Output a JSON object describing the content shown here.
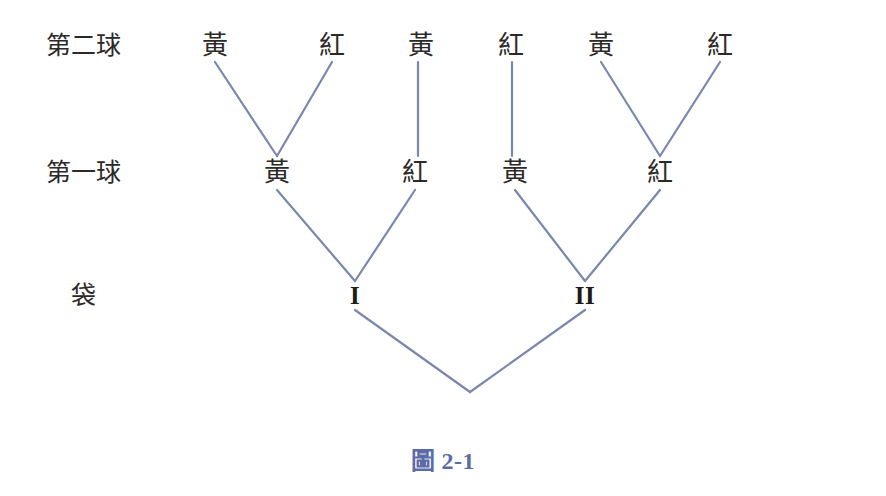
{
  "figure": {
    "caption_prefix": "圖",
    "caption_number": "2-1",
    "caption_color": "#5b6ba8",
    "background_color": "#ffffff",
    "edge_color": "#7b87ac",
    "edge_width": 2.2,
    "text_color": "#2c2a28"
  },
  "row_labels": [
    {
      "id": "row-second-ball",
      "text": "第二球",
      "x": 83,
      "y": 45
    },
    {
      "id": "row-first-ball",
      "text": "第一球",
      "x": 83,
      "y": 172
    },
    {
      "id": "row-bag",
      "text": "袋",
      "x": 83,
      "y": 295
    }
  ],
  "levels": {
    "second_ball_y": 45,
    "first_ball_y": 172,
    "bag_y": 295,
    "root_y": 392
  },
  "nodes": {
    "root": {
      "id": "root",
      "label": "",
      "x": 470,
      "y": 392
    },
    "bags": [
      {
        "id": "bag-1",
        "label": "I",
        "x": 355,
        "y": 295
      },
      {
        "id": "bag-2",
        "label": "II",
        "x": 585,
        "y": 295
      }
    ],
    "first_ball": [
      {
        "id": "first-ball-1",
        "label": "黃",
        "x": 277,
        "y": 172,
        "parent": "bag-1"
      },
      {
        "id": "first-ball-2",
        "label": "紅",
        "x": 415,
        "y": 172,
        "parent": "bag-1"
      },
      {
        "id": "first-ball-3",
        "label": "黃",
        "x": 515,
        "y": 172,
        "parent": "bag-2"
      },
      {
        "id": "first-ball-4",
        "label": "紅",
        "x": 660,
        "y": 172,
        "parent": "bag-2"
      }
    ],
    "second_ball": [
      {
        "id": "second-ball-1",
        "label": "黃",
        "x": 215,
        "y": 45,
        "parent": "first-ball-1"
      },
      {
        "id": "second-ball-2",
        "label": "紅",
        "x": 332,
        "y": 45,
        "parent": "first-ball-1"
      },
      {
        "id": "second-ball-3",
        "label": "黃",
        "x": 421,
        "y": 45,
        "parent": "first-ball-2"
      },
      {
        "id": "second-ball-4",
        "label": "紅",
        "x": 511,
        "y": 45,
        "parent": "first-ball-3"
      },
      {
        "id": "second-ball-5",
        "label": "黃",
        "x": 601,
        "y": 45,
        "parent": "first-ball-4"
      },
      {
        "id": "second-ball-6",
        "label": "紅",
        "x": 720,
        "y": 45,
        "parent": "first-ball-4"
      }
    ]
  },
  "edges": [
    {
      "id": "edge-root-bag1",
      "x1": 470,
      "y1": 392,
      "x2": 355,
      "y2": 310
    },
    {
      "id": "edge-root-bag2",
      "x1": 470,
      "y1": 392,
      "x2": 585,
      "y2": 310
    },
    {
      "id": "edge-bag1-yellow",
      "x1": 355,
      "y1": 281,
      "x2": 277,
      "y2": 190
    },
    {
      "id": "edge-bag1-red",
      "x1": 355,
      "y1": 281,
      "x2": 415,
      "y2": 190
    },
    {
      "id": "edge-bag2-yellow",
      "x1": 585,
      "y1": 281,
      "x2": 515,
      "y2": 190
    },
    {
      "id": "edge-bag2-red",
      "x1": 585,
      "y1": 281,
      "x2": 660,
      "y2": 190
    },
    {
      "id": "edge-fb1-yellow",
      "x1": 277,
      "y1": 156,
      "x2": 215,
      "y2": 62
    },
    {
      "id": "edge-fb1-red",
      "x1": 277,
      "y1": 156,
      "x2": 332,
      "y2": 62
    },
    {
      "id": "edge-fb2-yellow",
      "x1": 418,
      "y1": 156,
      "x2": 418,
      "y2": 62
    },
    {
      "id": "edge-fb3-red",
      "x1": 512,
      "y1": 156,
      "x2": 512,
      "y2": 62
    },
    {
      "id": "edge-fb4-yellow",
      "x1": 660,
      "y1": 156,
      "x2": 601,
      "y2": 62
    },
    {
      "id": "edge-fb4-red",
      "x1": 660,
      "y1": 156,
      "x2": 720,
      "y2": 62
    }
  ]
}
